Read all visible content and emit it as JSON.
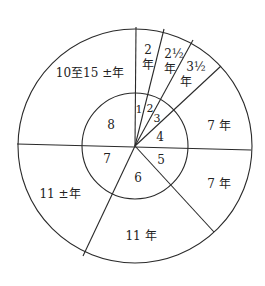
{
  "diagram": {
    "type": "concentric-pie",
    "center": [
      135,
      146
    ],
    "outer_radius": 117,
    "inner_radius": 53,
    "outer_segments": [
      {
        "id": 1,
        "label_line1": "2",
        "label_line2": "年"
      },
      {
        "id": 2,
        "label_line1": "2½",
        "label_line2": "年"
      },
      {
        "id": 3,
        "label_line1": "3½",
        "label_line2": "年"
      },
      {
        "id": 4,
        "label": "7 年"
      },
      {
        "id": 5,
        "label": "7 年"
      },
      {
        "id": 6,
        "label": "11 年"
      },
      {
        "id": 7,
        "label": "11 ±年"
      },
      {
        "id": 8,
        "label": "10至15 ±年"
      }
    ],
    "inner_numbers": [
      "1",
      "2",
      "3",
      "4",
      "5",
      "6",
      "7",
      "8"
    ],
    "colors": {
      "line": "#2a2a2a",
      "text": "#222222",
      "background": "#ffffff"
    }
  }
}
